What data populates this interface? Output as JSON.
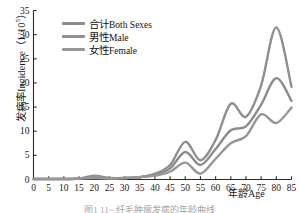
{
  "figure": {
    "caption": "图1  11~  纤毛肿瘤发病的年龄曲线"
  },
  "axis": {
    "y_title_cjk": "发病率",
    "y_title_latin": "Incidence",
    "y_title_unit_base": "（1/10",
    "y_title_unit_sup": "5",
    "y_title_unit_close": "）",
    "x_title": "年龄Age",
    "y_ticks": [
      "0",
      "5",
      "10",
      "15",
      "20",
      "25",
      "30",
      "35"
    ],
    "x_ticks": [
      "0",
      "5",
      "10",
      "15",
      "20",
      "25",
      "30",
      "35",
      "40",
      "45",
      "50",
      "55",
      "60",
      "65",
      "70",
      "75",
      "80",
      "85"
    ]
  },
  "legend": {
    "position": "upper-left-inside",
    "items": [
      {
        "cjk": "合计",
        "latin": "Both Sexes",
        "color": "#8c8c8c"
      },
      {
        "cjk": "男性",
        "latin": "Male",
        "color": "#8f8f8f"
      },
      {
        "cjk": "女性",
        "latin": "Female",
        "color": "#969696"
      }
    ]
  },
  "chart_data": {
    "type": "line",
    "title": "",
    "subtitle": "",
    "xlabel": "年龄Age",
    "ylabel": "发病率 Incidence（1/10^5）",
    "xlim": [
      0,
      85
    ],
    "ylim": [
      0,
      35
    ],
    "x_tick_step": 5,
    "y_tick_step": 5,
    "grid": false,
    "legend_position": "upper left",
    "x": [
      0,
      5,
      10,
      15,
      20,
      25,
      30,
      35,
      40,
      45,
      50,
      55,
      60,
      65,
      70,
      75,
      80,
      85
    ],
    "series": [
      {
        "name": "合计Both Sexes",
        "color": "#8c8c8c",
        "values": [
          0.1,
          0.1,
          0.1,
          0.2,
          0.5,
          0.3,
          0.3,
          0.5,
          1.0,
          2.3,
          5.7,
          3.0,
          6.3,
          10.2,
          11.0,
          15.5,
          21.0,
          16.3
        ]
      },
      {
        "name": "男性Male",
        "color": "#8f8f8f",
        "values": [
          0.1,
          0.1,
          0.1,
          0.2,
          0.8,
          0.3,
          0.3,
          0.5,
          1.2,
          3.0,
          7.8,
          4.0,
          8.2,
          15.7,
          13.0,
          19.5,
          31.5,
          19.2
        ]
      },
      {
        "name": "女性Female",
        "color": "#969696",
        "values": [
          0.1,
          0.1,
          0.1,
          0.2,
          0.3,
          0.2,
          0.3,
          0.5,
          0.8,
          1.6,
          3.5,
          1.2,
          4.3,
          7.5,
          9.0,
          13.5,
          11.7,
          14.9
        ]
      }
    ],
    "annotations": [
      {
        "text": "local peak at age 50",
        "x": 50
      },
      {
        "text": "local trough at age 55",
        "x": 55
      },
      {
        "text": "male global peak at age 80",
        "x": 80
      }
    ]
  },
  "style": {
    "axis_color": "#2b2b2b",
    "background": "#ffffff",
    "line_width": 2.4
  }
}
